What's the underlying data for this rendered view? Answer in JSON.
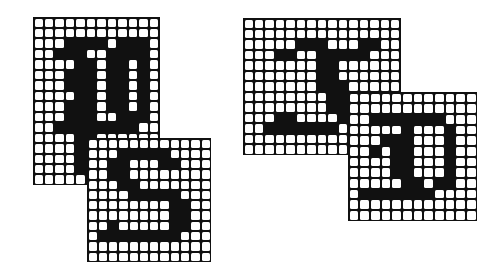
{
  "figure": {
    "ink_color": "#111111",
    "paper_color": "#ffffff",
    "glyphs": [
      {
        "id": "P",
        "letter": "P",
        "x": 33,
        "y": 17,
        "cols": 12,
        "rows": 16,
        "cell": 10.4,
        "bitmap": [
          "000000000000",
          "000000000000",
          "000111101110",
          "001110011110",
          "000011011010",
          "000111011010",
          "000111011010",
          "000011011010",
          "000111011010",
          "000111001110",
          "001111111100",
          "000011000000",
          "000011000000",
          "000011000000",
          "000011000000",
          "000000000000"
        ]
      },
      {
        "id": "S",
        "letter": "S",
        "x": 87,
        "y": 138,
        "cols": 12,
        "rows": 12,
        "cell": 10.2,
        "bitmap": [
          "000000000000",
          "000111110000",
          "001100011000",
          "001100000000",
          "000110000000",
          "000011111000",
          "000000001100",
          "000000001100",
          "001000001100",
          "011111111000",
          "000000000000",
          "000000000000"
        ]
      },
      {
        "id": "F",
        "letter": "F",
        "x": 243,
        "y": 18,
        "cols": 15,
        "rows": 13,
        "cell": 10.4,
        "bitmap": [
          "000000000000000",
          "000000000000000",
          "000001110001100",
          "000110011111000",
          "000000011000000",
          "000000011000000",
          "000000011100000",
          "000000001100000",
          "000000001100000",
          "000110000100000",
          "001111111000000",
          "000000000000000",
          "000000000000000"
        ]
      },
      {
        "id": "D",
        "letter": "D",
        "x": 348,
        "y": 92,
        "cols": 12,
        "rows": 12,
        "cell": 10.6,
        "bitmap": [
          "000000000000",
          "000000000000",
          "001111111000",
          "000001000100",
          "000111000100",
          "001011000100",
          "000011000100",
          "000011000100",
          "000001101100",
          "011111110000",
          "000000000000",
          "000000000000"
        ]
      }
    ]
  }
}
